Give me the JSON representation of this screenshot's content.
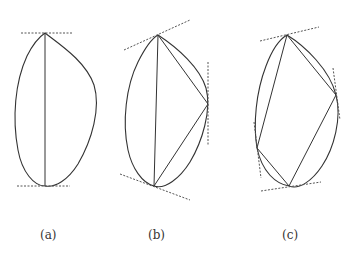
{
  "figures": [
    {
      "id": "a",
      "label": "(a)",
      "label_x": 48
    },
    {
      "id": "b",
      "label": "(b)",
      "label_x": 156
    },
    {
      "id": "c",
      "label": "(c)",
      "label_x": 290
    }
  ],
  "colors": {
    "stroke": "#333333",
    "tangent": "#555555",
    "background": "#ffffff"
  }
}
